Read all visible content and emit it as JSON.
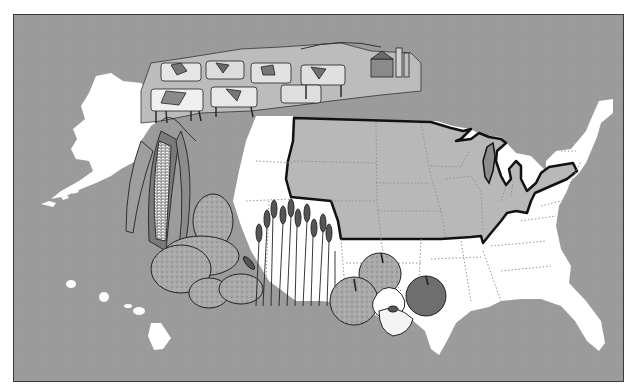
{
  "map": {
    "title": "",
    "subject": "United States agricultural regions",
    "highlighted_region": "Midwest",
    "colors": {
      "ocean": "#9b9b9b",
      "land": "#ffffff",
      "highlight": "#b8b8b8",
      "outline": "#111111",
      "state_border": "#8a8a8a",
      "great_lakes": "#8c8c8c"
    },
    "regions": [
      {
        "name": "alaska",
        "highlighted": false
      },
      {
        "name": "hawaii",
        "highlighted": false
      },
      {
        "name": "west",
        "highlighted": false
      },
      {
        "name": "midwest",
        "highlighted": true
      },
      {
        "name": "south",
        "highlighted": false
      },
      {
        "name": "northeast",
        "highlighted": false
      }
    ],
    "illustrations": [
      {
        "name": "dairy-cows-farm",
        "depicts": "dairy cattle herd grazing with barn and silos"
      },
      {
        "name": "corn",
        "depicts": "ears of corn"
      },
      {
        "name": "potatoes",
        "depicts": "potatoes"
      },
      {
        "name": "wheat",
        "depicts": "sheaf of wheat"
      },
      {
        "name": "apples",
        "depicts": "apples, one cut in half"
      }
    ]
  }
}
